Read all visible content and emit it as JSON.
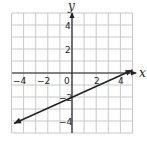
{
  "chart_data": {
    "type": "line",
    "title": "",
    "xlabel": "x",
    "ylabel": "y",
    "xlim": [
      -5,
      5
    ],
    "ylim": [
      -5,
      5
    ],
    "grid": true,
    "x_ticks": [
      "-4",
      "-2",
      "0",
      "2",
      "4"
    ],
    "y_ticks": [
      "4",
      "2",
      "-2",
      "-4"
    ],
    "series": [
      {
        "name": "line",
        "equation": "y = 0.45x - 2",
        "x": [
          -4.8,
          0,
          4.5,
          5
        ],
        "y": [
          -4.2,
          -2,
          0,
          0.25
        ],
        "arrows": "both"
      }
    ],
    "colors": {
      "grid": "#c8c8c8",
      "axis": "#222222",
      "line": "#222222"
    }
  }
}
